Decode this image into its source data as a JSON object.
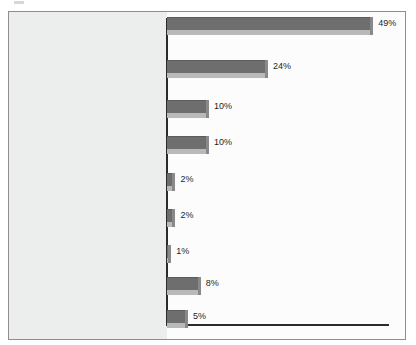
{
  "chart_data": {
    "type": "bar",
    "orientation": "horizontal",
    "title": "",
    "xlabel": "",
    "ylabel": "",
    "xlim": [
      0,
      52
    ],
    "grid": false,
    "legend": false,
    "value_suffix": "%",
    "categories": [
      "Beliefs that living together was\nwrong/Religion/Upbringing/\nSocial norms",
      "Love and commitment",
      "Had children/Expecting/\nWanted children",
      "It was time/Easier/\nJust wanted to",
      "Make a legal\ncommitment",
      "Young and stupid/\nYoung/Dumb",
      "Financial reasons/\nHealth benefits",
      "Other (Miscellaneous)",
      "Don't know"
    ],
    "values": [
      49,
      24,
      10,
      10,
      2,
      2,
      1,
      8,
      5
    ],
    "value_labels": [
      "49%",
      "24%",
      "10%",
      "10%",
      "2%",
      "2%",
      "1%",
      "8%",
      "5%"
    ],
    "colors": {
      "bar": "#6f6e6e",
      "bar_shadow": "#b9b9b9",
      "axis": "#2b2b2b",
      "plot_background": "#fcfcfc",
      "label_gutter_background": "#eceded",
      "frame_border": "#8e8e8e",
      "text": "#2d2d2d"
    }
  }
}
